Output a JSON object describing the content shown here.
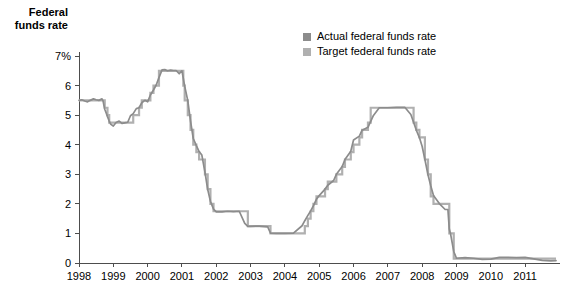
{
  "chart_data": {
    "type": "line",
    "title": "Federal\nfunds rate",
    "xlabel": "",
    "ylabel": "Federal funds rate",
    "xlim": [
      1998.0,
      2011.9
    ],
    "ylim": [
      0,
      7
    ],
    "grid": false,
    "legend_position": "top-center",
    "y_ticks": [
      "0",
      "1",
      "2",
      "3",
      "4",
      "5",
      "6",
      "7%"
    ],
    "y_tick_values": [
      0,
      1,
      2,
      3,
      4,
      5,
      6,
      7
    ],
    "x_ticks": [
      "1998",
      "1999",
      "2000",
      "2001",
      "2002",
      "2003",
      "2004",
      "2005",
      "2006",
      "2007",
      "2008",
      "2009",
      "2010",
      "2011"
    ],
    "x_tick_values": [
      1998,
      1999,
      2000,
      2001,
      2002,
      2003,
      2004,
      2005,
      2006,
      2007,
      2008,
      2009,
      2010,
      2011
    ],
    "colors": {
      "actual": "#8c8c8c",
      "target": "#b0b0b0",
      "axis": "#4d4d4d",
      "text": "#000000"
    },
    "series": [
      {
        "name": "Actual federal funds rate",
        "color": "#8c8c8c",
        "x": [
          1998.0,
          1998.08,
          1998.17,
          1998.25,
          1998.33,
          1998.42,
          1998.5,
          1998.58,
          1998.67,
          1998.7,
          1998.75,
          1998.8,
          1998.83,
          1998.88,
          1998.92,
          1999.0,
          1999.08,
          1999.17,
          1999.25,
          1999.33,
          1999.42,
          1999.5,
          1999.58,
          1999.67,
          1999.75,
          1999.83,
          1999.92,
          2000.0,
          2000.08,
          2000.17,
          2000.25,
          2000.33,
          2000.42,
          2000.5,
          2000.58,
          2000.67,
          2000.75,
          2000.83,
          2000.92,
          2001.0,
          2001.08,
          2001.17,
          2001.25,
          2001.33,
          2001.42,
          2001.5,
          2001.58,
          2001.67,
          2001.75,
          2001.83,
          2001.92,
          2002.0,
          2002.17,
          2002.33,
          2002.5,
          2002.67,
          2002.83,
          2002.92,
          2003.0,
          2003.25,
          2003.5,
          2003.58,
          2003.75,
          2004.0,
          2004.25,
          2004.5,
          2004.58,
          2004.67,
          2004.75,
          2004.83,
          2004.92,
          2005.0,
          2005.17,
          2005.25,
          2005.42,
          2005.5,
          2005.67,
          2005.75,
          2005.92,
          2006.0,
          2006.17,
          2006.25,
          2006.42,
          2006.5,
          2006.58,
          2006.75,
          2007.0,
          2007.25,
          2007.5,
          2007.67,
          2007.75,
          2007.83,
          2007.92,
          2008.0,
          2008.08,
          2008.17,
          2008.25,
          2008.33,
          2008.5,
          2008.67,
          2008.75,
          2008.79,
          2008.83,
          2008.92,
          2009.0,
          2009.25,
          2009.5,
          2009.75,
          2010.0,
          2010.25,
          2010.5,
          2010.75,
          2011.0,
          2011.25,
          2011.5,
          2011.75,
          2011.9
        ],
        "y": [
          5.5,
          5.52,
          5.48,
          5.45,
          5.5,
          5.55,
          5.52,
          5.5,
          5.55,
          5.48,
          5.2,
          5.05,
          4.95,
          4.8,
          4.7,
          4.63,
          4.75,
          4.8,
          4.72,
          4.74,
          4.76,
          4.98,
          5.05,
          5.22,
          5.25,
          5.42,
          5.5,
          5.45,
          5.68,
          5.85,
          6.02,
          6.27,
          6.53,
          6.54,
          6.5,
          6.52,
          6.51,
          6.51,
          6.4,
          6.5,
          5.98,
          5.49,
          4.8,
          4.21,
          3.97,
          3.77,
          3.65,
          3.07,
          2.49,
          2.09,
          1.82,
          1.73,
          1.73,
          1.75,
          1.74,
          1.75,
          1.34,
          1.24,
          1.24,
          1.25,
          1.22,
          1.01,
          1.0,
          1.0,
          1.01,
          1.26,
          1.43,
          1.61,
          1.76,
          1.93,
          2.16,
          2.28,
          2.5,
          2.63,
          2.79,
          3.0,
          3.26,
          3.5,
          3.78,
          4.16,
          4.29,
          4.49,
          4.59,
          4.79,
          4.99,
          5.25,
          5.25,
          5.26,
          5.26,
          5.02,
          4.76,
          4.49,
          4.24,
          3.94,
          3.5,
          2.98,
          2.61,
          2.28,
          2.01,
          1.81,
          1.81,
          1.15,
          0.97,
          0.39,
          0.16,
          0.18,
          0.16,
          0.12,
          0.13,
          0.19,
          0.19,
          0.18,
          0.19,
          0.14,
          0.09,
          0.07,
          0.08
        ]
      },
      {
        "name": "Target federal funds rate",
        "color": "#b0b0b0",
        "x": [
          1998.0,
          1998.7,
          1998.75,
          1998.8,
          1998.83,
          1998.88,
          1999.5,
          1999.58,
          1999.67,
          1999.75,
          1999.83,
          2000.0,
          2000.08,
          2000.17,
          2000.25,
          2000.33,
          2000.42,
          2001.0,
          2001.04,
          2001.08,
          2001.17,
          2001.25,
          2001.33,
          2001.42,
          2001.5,
          2001.67,
          2001.75,
          2001.83,
          2001.92,
          2002.83,
          2002.92,
          2003.5,
          2003.58,
          2004.5,
          2004.58,
          2004.67,
          2004.75,
          2004.83,
          2004.92,
          2005.0,
          2005.17,
          2005.25,
          2005.42,
          2005.5,
          2005.67,
          2005.75,
          2005.92,
          2006.0,
          2006.17,
          2006.25,
          2006.42,
          2006.5,
          2007.67,
          2007.75,
          2007.83,
          2007.92,
          2008.08,
          2008.17,
          2008.25,
          2008.33,
          2008.75,
          2008.79,
          2008.92,
          2011.9
        ],
        "y": [
          5.5,
          5.5,
          5.25,
          5.25,
          5.0,
          4.75,
          4.75,
          5.0,
          5.0,
          5.25,
          5.5,
          5.5,
          5.75,
          6.0,
          6.0,
          6.5,
          6.5,
          6.5,
          6.0,
          5.5,
          5.0,
          4.5,
          4.0,
          3.75,
          3.5,
          3.0,
          2.5,
          2.0,
          1.75,
          1.75,
          1.25,
          1.25,
          1.0,
          1.0,
          1.25,
          1.5,
          1.75,
          2.0,
          2.25,
          2.25,
          2.5,
          2.75,
          2.75,
          3.0,
          3.25,
          3.5,
          3.75,
          4.0,
          4.25,
          4.5,
          4.75,
          5.25,
          5.25,
          4.75,
          4.5,
          4.25,
          3.5,
          3.0,
          2.25,
          2.0,
          2.0,
          1.0,
          0.15,
          0.15
        ]
      }
    ]
  },
  "legend": {
    "items": [
      {
        "label": "Actual federal funds rate",
        "color": "#8c8c8c"
      },
      {
        "label": "Target federal funds rate",
        "color": "#b0b0b0"
      }
    ]
  }
}
